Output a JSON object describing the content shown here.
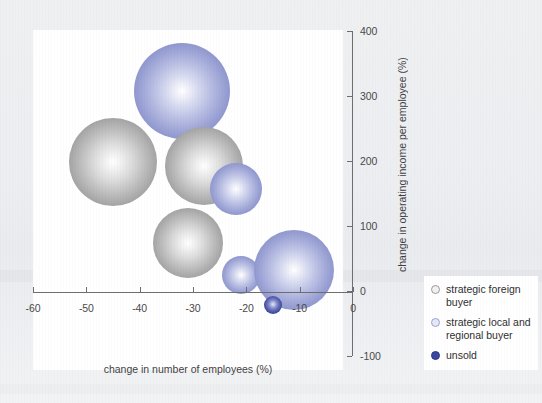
{
  "chart_data": {
    "type": "scatter",
    "title": "",
    "subtitle": "",
    "xlabel": "change in number of employees (%)",
    "ylabel": "change in operating income per employee (%)",
    "xlim": [
      -60,
      0
    ],
    "ylim": [
      -100,
      400
    ],
    "xticks": [
      "-60",
      "-50",
      "-40",
      "-30",
      "-20",
      "-10",
      "0"
    ],
    "xtick_values": [
      -60,
      -50,
      -40,
      -30,
      -20,
      -10,
      0
    ],
    "yticks": [
      "400",
      "300",
      "200",
      "100",
      "0",
      "-100"
    ],
    "ytick_values": [
      400,
      300,
      200,
      100,
      0,
      -100
    ],
    "grid": false,
    "legend_position": "bottom-right",
    "bubble_note": "bubble area encodes company size; x/y are percentage changes",
    "series": [
      {
        "name": "strategic foreign buyer",
        "color": "#9a9a9a",
        "points": [
          {
            "x": -45,
            "y": 198,
            "size": 88
          },
          {
            "x": -28,
            "y": 192,
            "size": 78
          },
          {
            "x": -31,
            "y": 74,
            "size": 70
          }
        ]
      },
      {
        "name": "strategic local and regional buyer",
        "color": "#767fc2",
        "points": [
          {
            "x": -32,
            "y": 307,
            "size": 96
          },
          {
            "x": -22,
            "y": 157,
            "size": 52
          },
          {
            "x": -11,
            "y": 32,
            "size": 80
          },
          {
            "x": -21,
            "y": 24,
            "size": 38
          }
        ]
      },
      {
        "name": "unsold",
        "color": "#2b3890",
        "points": [
          {
            "x": -15,
            "y": -22,
            "size": 18
          }
        ]
      }
    ]
  },
  "axes": {
    "x_title": "change in number of employees (%)",
    "y_title": "change in operating income per employee (%)",
    "x_tick_labels": [
      "-60",
      "-50",
      "-40",
      "-30",
      "-20",
      "-10",
      "0"
    ],
    "y_tick_labels": [
      "400",
      "300",
      "200",
      "100",
      "0",
      "-100"
    ]
  },
  "legend": {
    "items": [
      {
        "label": "strategic foreign buyer",
        "marker": "circle-outline-gray",
        "color": "#9a9a9a"
      },
      {
        "label": "strategic local and regional buyer",
        "marker": "circle-outline-light-blue",
        "color": "#9aa2d4"
      },
      {
        "label": "unsold",
        "marker": "circle-filled-dark-blue",
        "color": "#2b3890"
      }
    ]
  },
  "caption_sliver": ""
}
